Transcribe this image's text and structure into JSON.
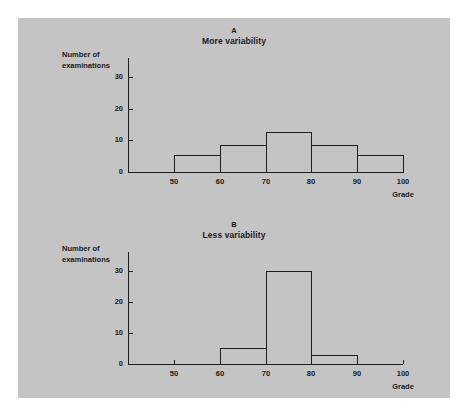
{
  "figure": {
    "background_color": "#c4c4c4",
    "line_color": "#1f1f1f",
    "text_color": "#1a1a1a"
  },
  "chart_data": [
    {
      "type": "bar",
      "panel_id": "A",
      "panel_letter": "A",
      "title": "More variability",
      "xlabel": "Grade",
      "ylabel": "Number of examinations",
      "ylabel_line1": "Number of",
      "ylabel_line2": "examinations",
      "bin_edges": [
        50,
        60,
        70,
        80,
        90,
        100
      ],
      "categories": [
        "50-60",
        "60-70",
        "70-80",
        "80-90",
        "90-100"
      ],
      "values": [
        5.5,
        8.5,
        12.5,
        8.5,
        5.5
      ],
      "xlim": [
        40,
        100
      ],
      "ylim": [
        0,
        36
      ],
      "xticks": [
        50,
        60,
        70,
        80,
        90,
        100
      ],
      "xtick_labels": [
        "50",
        "60",
        "70",
        "80",
        "90",
        "100"
      ],
      "yticks": [
        0,
        10,
        20,
        30
      ],
      "ytick_labels": [
        "0",
        "10",
        "20",
        "30"
      ],
      "grid": false,
      "legend": false,
      "bar_style": "outline"
    },
    {
      "type": "bar",
      "panel_id": "B",
      "panel_letter": "B",
      "title": "Less variability",
      "xlabel": "Grade",
      "ylabel": "Number of examinations",
      "ylabel_line1": "Number of",
      "ylabel_line2": "examinations",
      "bin_edges": [
        60,
        70,
        80,
        90
      ],
      "categories": [
        "60-70",
        "70-80",
        "80-90"
      ],
      "values": [
        5,
        30,
        3
      ],
      "xlim": [
        40,
        100
      ],
      "ylim": [
        0,
        36
      ],
      "xticks": [
        50,
        60,
        70,
        80,
        90,
        100
      ],
      "xtick_labels": [
        "50",
        "60",
        "70",
        "80",
        "90",
        "100"
      ],
      "xticks_drawn": [
        50,
        100
      ],
      "yticks": [
        0,
        10,
        20,
        30
      ],
      "ytick_labels": [
        "0",
        "10",
        "20",
        "30"
      ],
      "grid": false,
      "legend": false,
      "bar_style": "outline"
    }
  ]
}
